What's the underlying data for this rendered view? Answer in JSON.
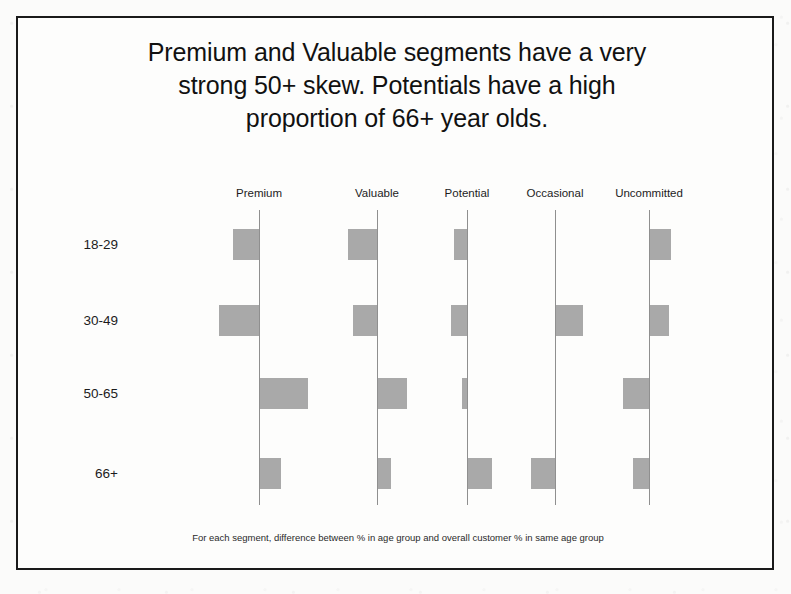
{
  "slide": {
    "title_lines": [
      "Premium and Valuable segments have a very",
      "strong 50+ skew.  Potentials have a high",
      "proportion of 66+ year olds."
    ],
    "footnote": "For each segment, difference between % in age group and overall customer % in same age group",
    "border_color": "#1a1a1a",
    "background_color": "#fdfdfc"
  },
  "chart_data": {
    "type": "bar",
    "orientation": "horizontal-diverging",
    "title": "Premium and Valuable segments have a very strong 50+ skew.  Potentials have a high proportion of 66+ year olds.",
    "subtitle": "",
    "xlabel": "",
    "ylabel": "",
    "annotations": [
      "For each segment, difference between % in age group and overall customer % in same age group"
    ],
    "legend": [],
    "legend_position": "none",
    "grid": false,
    "bar_color": "#a9a9a9",
    "axis_color": "#8f8f8f",
    "value_units": "percentage-point difference vs overall customer base",
    "categories": [
      "18-29",
      "30-49",
      "50-65",
      "66+"
    ],
    "panels": [
      "Premium",
      "Valuable",
      "Potential",
      "Occasional",
      "Uncommitted"
    ],
    "xlim": [
      -9,
      9
    ],
    "series": [
      {
        "name": "Premium",
        "values": [
          -5.0,
          -7.5,
          9.0,
          4.0
        ]
      },
      {
        "name": "Valuable",
        "values": [
          -5.5,
          -4.5,
          5.5,
          2.5
        ]
      },
      {
        "name": "Potential",
        "values": [
          -2.5,
          -3.0,
          -1.0,
          4.5
        ]
      },
      {
        "name": "Occasional",
        "values": [
          0.0,
          5.0,
          0.0,
          -4.5
        ]
      },
      {
        "name": "Uncommitted",
        "values": [
          4.0,
          3.5,
          -5.0,
          -3.0
        ]
      }
    ]
  },
  "layout": {
    "axis_x": [
      241,
      359,
      449,
      537,
      631
    ],
    "row_y": [
      226,
      302,
      375,
      455
    ],
    "px_per_unit": 5.3,
    "bar_height": 31
  }
}
